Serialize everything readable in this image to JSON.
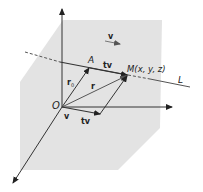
{
  "diagram": {
    "labels": {
      "direction_vector": "v",
      "point_A": "A",
      "tv_upper": "tv",
      "point_M": "M(x, y, z)",
      "line": "L",
      "r0_base": "r",
      "r0_sub": "0",
      "r": "r",
      "origin": "O",
      "v_lower": "v",
      "tv_lower": "tv"
    },
    "colors": {
      "plane": "#e3e3e3",
      "axis": "#333333",
      "vector": "#444444",
      "line": "#555555"
    }
  }
}
